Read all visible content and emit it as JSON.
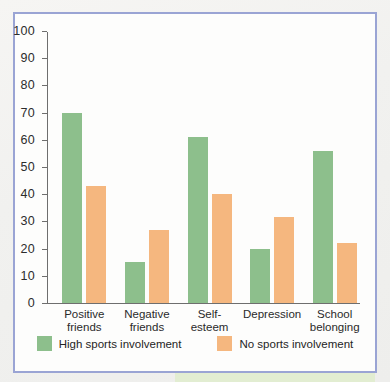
{
  "figure": {
    "frame_color": "#9aa4d4",
    "background": "#fdfdfc"
  },
  "chart_data": {
    "type": "bar",
    "title": "",
    "subtitle": "",
    "xlabel": "",
    "ylabel": "",
    "ylim": [
      0,
      100
    ],
    "yticks": [
      0,
      10,
      20,
      30,
      40,
      50,
      60,
      70,
      80,
      90,
      100
    ],
    "ytick_labels": [
      "0",
      "10",
      "20",
      "30",
      "40",
      "50",
      "60",
      "70",
      "80",
      "90",
      "100"
    ],
    "grid": false,
    "legend_position": "bottom-center",
    "categories": [
      "Positive\nfriends",
      "Negative\nfriends",
      "Self-\nesteem",
      "Depression",
      "School\nbelonging"
    ],
    "series": [
      {
        "name": "High sports involvement",
        "color": "#8dbf8c",
        "values": [
          70,
          15,
          61,
          20,
          56
        ]
      },
      {
        "name": "No sports involvement",
        "color": "#f5b77f",
        "values": [
          43,
          27,
          40,
          31.5,
          22
        ]
      }
    ]
  },
  "legend": {
    "items": [
      {
        "label": "High sports involvement",
        "color": "#8dbf8c"
      },
      {
        "label": "No sports involvement",
        "color": "#f5b77f"
      }
    ]
  }
}
